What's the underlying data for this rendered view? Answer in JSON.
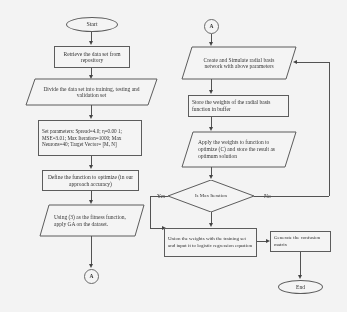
{
  "diagram": {
    "left_column": {
      "start": "Start",
      "retrieve": "Retrieve the data set from repository",
      "divide": "Divide the data set into training, testing and validation set",
      "parameters": "Set parameters: Spread=4.0; η=0.00 1; MSE=3.01; Max Iteration=1000; Max Neurons=40; Target Vector= [M, N]",
      "define_function": "Define the function to optimize (in our approach accuracy)",
      "apply_ga": "Using (3) as the fitness function, apply GA on the dataset.",
      "connector_out": "A"
    },
    "right_column": {
      "connector_in": "A",
      "create_simulate": "Create and Simulate radial basis network with above parameters",
      "store_weights": "Store the weights of the radial basis function in buffer",
      "apply_weights": "Apply the weights to function to optimize (C) and store the result as optimum solution",
      "decision": "Is Max Iteration",
      "decision_yes": "Yes",
      "decision_no": "No",
      "union_weights": "Union the weights with the training set and input it to logistic regression equation",
      "confusion_matrix": "Generate the confusion matrix",
      "end": "End"
    }
  },
  "colors": {
    "stroke": "#555555",
    "line": "#4a4a4a",
    "background": "#fdfdfd",
    "text": "#242424"
  }
}
